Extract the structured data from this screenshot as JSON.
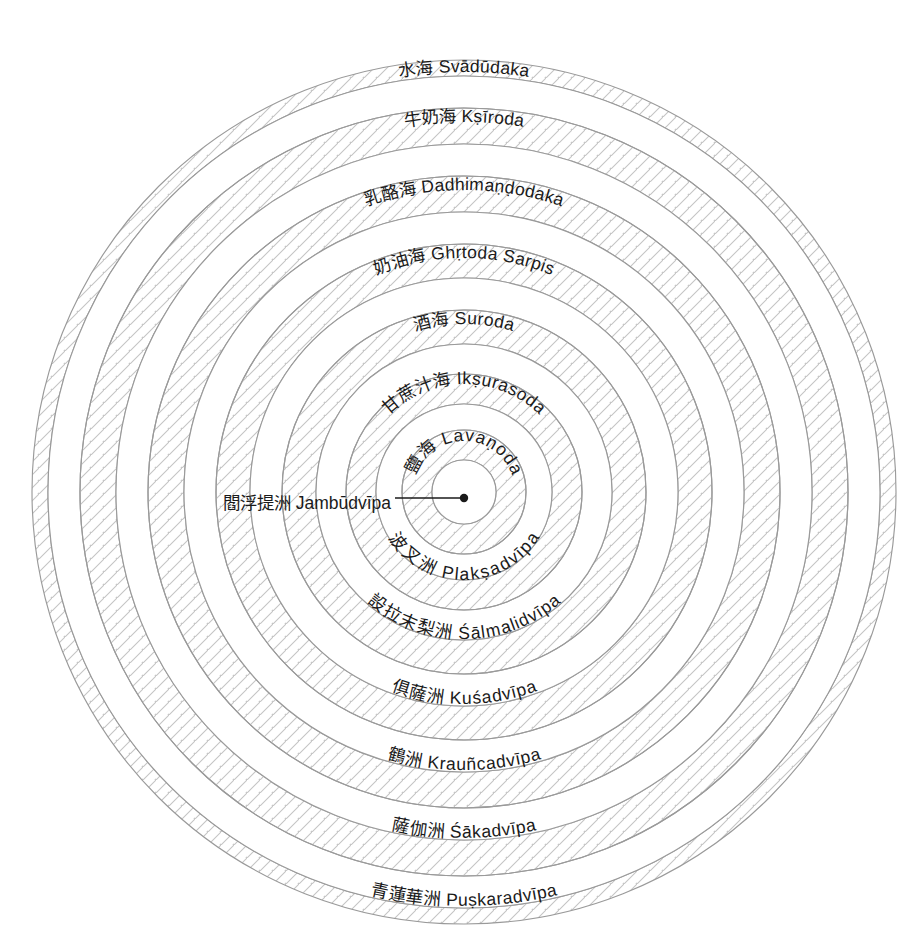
{
  "diagram": {
    "center_marker": "center-dot",
    "colors": {
      "outline": "#9a9a9a",
      "hatch": "#bdbdbd",
      "text": "#1a1a1a",
      "background": "#ffffff",
      "leader_line": "#1a1a1a"
    },
    "center_pointer": {
      "label": "閻浮提洲 Jambūdvīpa",
      "chinese": "閻浮提洲",
      "sanskrit": "Jambūdvīpa",
      "leader_text_x": 216,
      "leader_text_y": 501
    },
    "rings": [
      {
        "index": 0,
        "kind": "ocean",
        "label": "鹽海 Lavaṇoda",
        "chinese": "鹽海",
        "sanskrit": "Lavaṇoda",
        "r_inner": 32,
        "r_outer": 62,
        "label_r": 47,
        "label_side": "top",
        "hatched": true
      },
      {
        "index": 1,
        "kind": "continent",
        "label": "波叉洲 Plakṣadvīpa",
        "chinese": "波叉洲",
        "sanskrit": "Plakṣadvīpa",
        "r_inner": 62,
        "r_outer": 88,
        "label_r": 74,
        "label_side": "bottom",
        "hatched": false
      },
      {
        "index": 2,
        "kind": "ocean",
        "label": "甘蔗汁海 Ikṣurasoda",
        "chinese": "甘蔗汁海",
        "sanskrit": "Ikṣurasoda",
        "r_inner": 88,
        "r_outer": 118,
        "label_r": 104,
        "label_side": "top",
        "hatched": true
      },
      {
        "index": 3,
        "kind": "continent",
        "label": "設拉末梨洲 Śālmalidvīpa",
        "chinese": "設拉末梨洲",
        "sanskrit": "Śālmalidvīpa",
        "r_inner": 118,
        "r_outer": 148,
        "label_r": 133,
        "label_side": "bottom",
        "hatched": false
      },
      {
        "index": 4,
        "kind": "ocean",
        "label": "酒海 Suroda",
        "chinese": "酒海",
        "sanskrit": "Suroda",
        "r_inner": 148,
        "r_outer": 182,
        "label_r": 164,
        "label_side": "top",
        "hatched": true
      },
      {
        "index": 5,
        "kind": "continent",
        "label": "俱薩洲 Kuśadvīpa",
        "chinese": "俱薩洲",
        "sanskrit": "Kuśadvīpa",
        "r_inner": 182,
        "r_outer": 214,
        "label_r": 198,
        "label_side": "bottom",
        "hatched": false
      },
      {
        "index": 6,
        "kind": "ocean",
        "label": "奶油海 Ghṛtoda Sarpis",
        "chinese": "奶油海",
        "sanskrit": "Ghṛtoda Sarpis",
        "r_inner": 214,
        "r_outer": 248,
        "label_r": 230,
        "label_side": "top",
        "hatched": true
      },
      {
        "index": 7,
        "kind": "continent",
        "label": "鶴洲 Krauñcadvīpa",
        "chinese": "鶴洲",
        "sanskrit": "Krauñcadvīpa",
        "r_inner": 248,
        "r_outer": 280,
        "label_r": 264,
        "label_side": "bottom",
        "hatched": false
      },
      {
        "index": 8,
        "kind": "ocean",
        "label": "乳酪海 Dadhimaṇḍodaka",
        "chinese": "乳酪海",
        "sanskrit": "Dadhimaṇḍodaka",
        "r_inner": 280,
        "r_outer": 316,
        "label_r": 298,
        "label_side": "top",
        "hatched": true
      },
      {
        "index": 9,
        "kind": "continent",
        "label": "薩伽洲 Śākadvīpa",
        "chinese": "薩伽洲",
        "sanskrit": "Śākadvīpa",
        "r_inner": 316,
        "r_outer": 348,
        "label_r": 332,
        "label_side": "bottom",
        "hatched": false
      },
      {
        "index": 10,
        "kind": "ocean",
        "label": "牛奶海 Kṣīroda",
        "chinese": "牛奶海",
        "sanskrit": "Kṣīroda",
        "r_inner": 348,
        "r_outer": 384,
        "label_r": 366,
        "label_side": "top",
        "hatched": true
      },
      {
        "index": 11,
        "kind": "continent",
        "label": "青蓮華洲 Puṣkaradvīpa",
        "chinese": "青蓮華洲",
        "sanskrit": "Puṣkaradvīpa",
        "r_inner": 384,
        "r_outer": 416,
        "label_r": 400,
        "label_side": "bottom",
        "hatched": false
      },
      {
        "index": 12,
        "kind": "ocean",
        "label": "水海 Svādūdaka",
        "chinese": "水海",
        "sanskrit": "Svādūdaka",
        "r_inner": 416,
        "r_outer": 416,
        "label_r": 416,
        "label_side": "top",
        "hatched": true
      }
    ],
    "geometry": {
      "cx": 464,
      "cy": 492,
      "outer_radius": 432
    }
  }
}
